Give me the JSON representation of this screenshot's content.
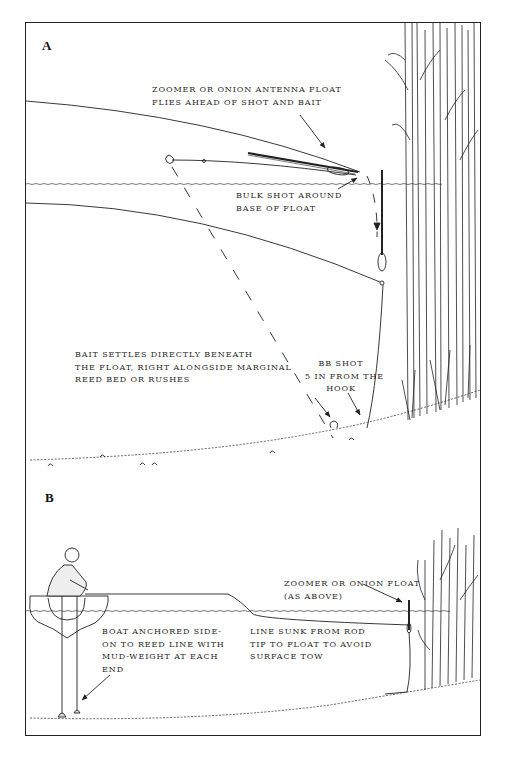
{
  "panel_a": {
    "letter": "A",
    "labels": {
      "float_flight": [
        "ZOOMER OR ONION ANTENNA FLOAT",
        "FLIES AHEAD OF SHOT AND BAIT"
      ],
      "bulk_shot": [
        "BULK SHOT AROUND",
        "BASE OF FLOAT"
      ],
      "bait_settles": [
        "BAIT SETTLES DIRECTLY BENEATH",
        "THE FLOAT, RIGHT ALONGSIDE MARGINAL",
        "REED BED OR RUSHES"
      ],
      "bb_shot": [
        "BB SHOT",
        "5 IN FROM THE",
        "HOOK"
      ]
    }
  },
  "panel_b": {
    "letter": "B",
    "labels": {
      "float": [
        "ZOOMER OR ONION FLOAT",
        "(AS ABOVE)"
      ],
      "boat": [
        "BOAT ANCHORED SIDE-",
        "ON TO REED LINE WITH",
        "MUD-WEIGHT AT EACH",
        "END"
      ],
      "line": [
        "LINE SUNK FROM ROD",
        "TIP TO FLOAT TO AVOID",
        "SURFACE TOW"
      ]
    }
  },
  "colors": {
    "ink": "#222222",
    "paper": "#ffffff"
  }
}
